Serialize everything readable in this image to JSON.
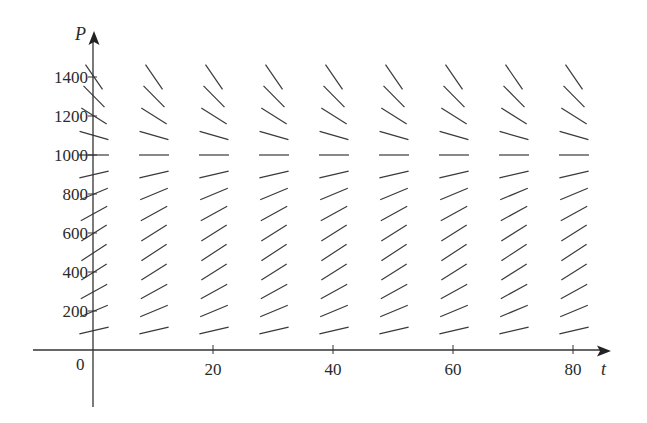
{
  "chart_data": {
    "type": "slope_field",
    "title": "",
    "equation_estimate": "dP/dt = 0.08 P (1 - P/1000)",
    "xlabel": "t",
    "ylabel": "P",
    "origin_label": "0",
    "xlim": [
      -10,
      86
    ],
    "ylim": [
      -300,
      1520
    ],
    "x_ticks": [
      20,
      40,
      60,
      80
    ],
    "x_tick_labels": [
      "20",
      "40",
      "60",
      "80"
    ],
    "y_ticks": [
      200,
      400,
      600,
      800,
      1000,
      1200,
      1400
    ],
    "y_tick_labels": [
      "200",
      "400",
      "600",
      "800",
      "1000",
      "1200",
      "1400"
    ],
    "grid": false,
    "field_t_values": [
      0,
      10,
      20,
      30,
      40,
      50,
      60,
      70,
      80
    ],
    "field_P_values": [
      100,
      200,
      300,
      400,
      500,
      600,
      700,
      800,
      900,
      1000,
      1100,
      1200,
      1300,
      1400
    ],
    "growth_rate_k": 0.08,
    "carrying_capacity": 1000,
    "segment_length_px": 30,
    "line_color": "#3a3a3a"
  },
  "labels": {
    "x_axis": "t",
    "y_axis": "P",
    "origin": "0",
    "x_ticks": [
      "20",
      "40",
      "60",
      "80"
    ],
    "y_ticks": [
      "1400",
      "1200",
      "1000",
      "800",
      "600",
      "400",
      "200"
    ]
  }
}
